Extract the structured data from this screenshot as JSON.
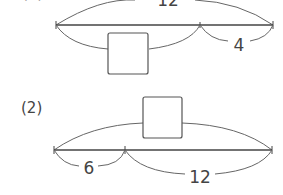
{
  "problems": [
    {
      "label": "(1)",
      "total": "12",
      "known": "4",
      "unknown": "?"
    },
    {
      "label": "(2)",
      "total": "?",
      "part_left": "6",
      "part_right": "12"
    }
  ],
  "colors": {
    "line": "#444444",
    "arc": "#666666",
    "box": "#555555"
  }
}
